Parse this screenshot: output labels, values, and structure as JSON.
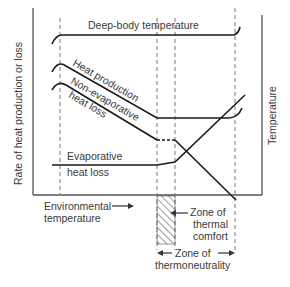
{
  "diagram": {
    "y_axis_left_label": "Rate of heat production or loss",
    "y_axis_right_label": "Temperature",
    "x_axis_label_line1": "Environmental",
    "x_axis_label_line2": "temperature",
    "curves": {
      "deep_body": "Deep-body temperature",
      "heat_production": "Heat production",
      "non_evap_line1": "Non-evaporative",
      "non_evap_line2": "heat loss",
      "evap_line1": "Evaporative",
      "evap_line2": "heat loss"
    },
    "zones": {
      "comfort_line1": "Zone of",
      "comfort_line2": "thermal",
      "comfort_line3": "comfort",
      "thermo_line1": "Zone of",
      "thermo_line2": "thermoneutrality"
    },
    "colors": {
      "line": "#1a1a1a",
      "text": "#3a3a3a",
      "dash": "#666666"
    }
  }
}
